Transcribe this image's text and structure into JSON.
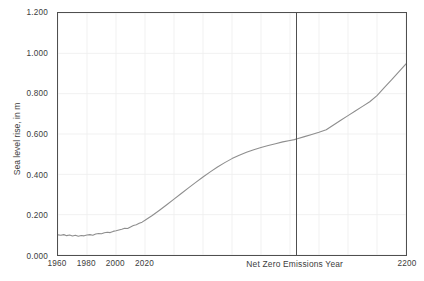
{
  "chart_data": {
    "type": "line",
    "title": "",
    "subtitle": "",
    "xlabel": "Net Zero Emissions Year",
    "ylabel": "Sea level rise, in m",
    "xlim": [
      1960,
      2200
    ],
    "ylim": [
      0.0,
      1.2
    ],
    "grid": true,
    "legend": null,
    "y_ticks": [
      {
        "value": 1.2,
        "label": "1.200"
      },
      {
        "value": 1.0,
        "label": "1.000"
      },
      {
        "value": 0.8,
        "label": "0.800"
      },
      {
        "value": 0.6,
        "label": "0.600"
      },
      {
        "value": 0.4,
        "label": "0.400"
      },
      {
        "value": 0.2,
        "label": "0.200"
      },
      {
        "value": 0.0,
        "label": "0.000"
      }
    ],
    "x_ticks": [
      {
        "value": 1960,
        "label": "1960"
      },
      {
        "value": 1980,
        "label": "1980"
      },
      {
        "value": 2000,
        "label": "2000"
      },
      {
        "value": 2020,
        "label": "2020"
      },
      {
        "value": 2200,
        "label": "2200"
      }
    ],
    "annotations": [
      {
        "name": "net-zero-emissions-year",
        "type": "vertical-line",
        "x": 2123,
        "label": "Net Zero Emissions Year",
        "color": "#4f4f4f"
      }
    ],
    "series": [
      {
        "name": "Sea level rise",
        "color": "#8e8e8e",
        "x": [
          1960,
          1962,
          1964,
          1966,
          1968,
          1970,
          1972,
          1974,
          1976,
          1978,
          1980,
          1982,
          1984,
          1986,
          1988,
          1990,
          1992,
          1994,
          1996,
          1998,
          2000,
          2002,
          2004,
          2006,
          2008,
          2010,
          2012,
          2014,
          2016,
          2018,
          2020,
          2025,
          2030,
          2035,
          2040,
          2045,
          2050,
          2055,
          2060,
          2065,
          2070,
          2075,
          2080,
          2085,
          2090,
          2095,
          2100,
          2105,
          2110,
          2115,
          2120,
          2123,
          2125,
          2130,
          2135,
          2140,
          2145,
          2150,
          2155,
          2160,
          2165,
          2170,
          2175,
          2180,
          2185,
          2190,
          2195,
          2200
        ],
        "values": [
          0.1,
          0.098,
          0.101,
          0.096,
          0.099,
          0.094,
          0.098,
          0.093,
          0.097,
          0.095,
          0.099,
          0.101,
          0.098,
          0.104,
          0.107,
          0.105,
          0.11,
          0.113,
          0.111,
          0.117,
          0.12,
          0.124,
          0.128,
          0.133,
          0.131,
          0.139,
          0.146,
          0.15,
          0.157,
          0.163,
          0.172,
          0.196,
          0.222,
          0.249,
          0.277,
          0.305,
          0.333,
          0.36,
          0.387,
          0.412,
          0.436,
          0.458,
          0.478,
          0.495,
          0.509,
          0.522,
          0.533,
          0.543,
          0.552,
          0.561,
          0.568,
          0.572,
          0.576,
          0.587,
          0.598,
          0.609,
          0.621,
          0.645,
          0.668,
          0.691,
          0.714,
          0.737,
          0.76,
          0.79,
          0.83,
          0.868,
          0.908,
          0.948
        ]
      }
    ]
  }
}
